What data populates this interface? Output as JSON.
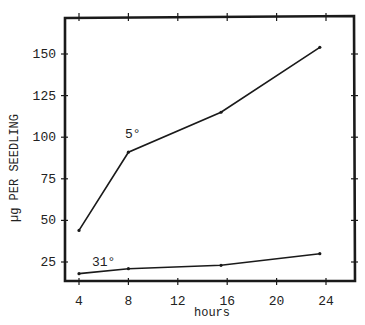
{
  "chart_data": {
    "type": "line",
    "title": "",
    "xlabel": "hours",
    "ylabel": "µg PER SEEDLING",
    "xlim": [
      3,
      26
    ],
    "ylim": [
      14,
      172
    ],
    "xticks": [
      4,
      8,
      12,
      16,
      20,
      24
    ],
    "yticks": [
      25,
      50,
      75,
      100,
      125,
      150
    ],
    "grid": false,
    "legend": "inline labels",
    "series": [
      {
        "name": "5°",
        "x": [
          4,
          8,
          15.5,
          23.5
        ],
        "values": [
          44,
          91,
          115,
          154
        ]
      },
      {
        "name": "31°",
        "x": [
          4,
          8,
          15.5,
          23.5
        ],
        "values": [
          18,
          21,
          23,
          30
        ]
      }
    ]
  },
  "colors": {
    "line": "#1a1a1a",
    "background": "#ffffff"
  }
}
